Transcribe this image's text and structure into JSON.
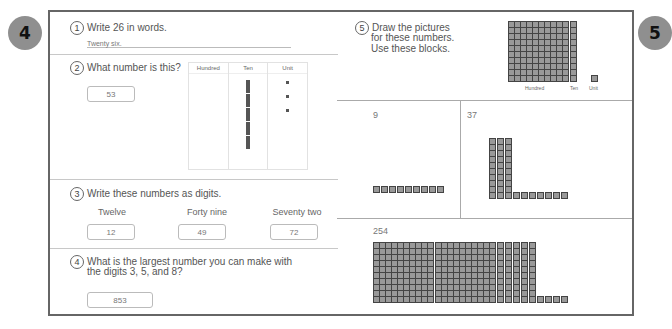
{
  "pages": {
    "left_number": "4",
    "right_number": "5"
  },
  "left": {
    "q1": {
      "num": "1",
      "text": "Write 26 in words.",
      "answer": "Twenty six."
    },
    "q2": {
      "num": "2",
      "text": "What number is this?",
      "answer": "53",
      "chart": {
        "headers": [
          "Hundred",
          "Ten",
          "Unit"
        ],
        "hundreds": 0,
        "tens": 5,
        "units": 3
      }
    },
    "q3": {
      "num": "3",
      "text": "Write these numbers as digits.",
      "items": [
        {
          "word": "Twelve",
          "answer": "12"
        },
        {
          "word": "Forty nine",
          "answer": "49"
        },
        {
          "word": "Seventy two",
          "answer": "72"
        }
      ]
    },
    "q4": {
      "num": "4",
      "text_line1": "What is the largest number you can make with",
      "text_line2": "the digits 3, 5, and 8?",
      "answer": "853"
    }
  },
  "right": {
    "q5": {
      "num": "5",
      "text_line1": "Draw the pictures",
      "text_line2": "for these numbers.",
      "text_line3": "Use these blocks.",
      "legend": {
        "hundred": "Hundred",
        "ten": "Ten",
        "unit": "Unit"
      }
    },
    "cells": [
      {
        "number": "9",
        "hundreds": 0,
        "tens": 0,
        "units": 9
      },
      {
        "number": "37",
        "hundreds": 0,
        "tens": 3,
        "units": 7
      },
      {
        "number": "254",
        "hundreds": 2,
        "tens": 5,
        "units": 4
      }
    ]
  }
}
